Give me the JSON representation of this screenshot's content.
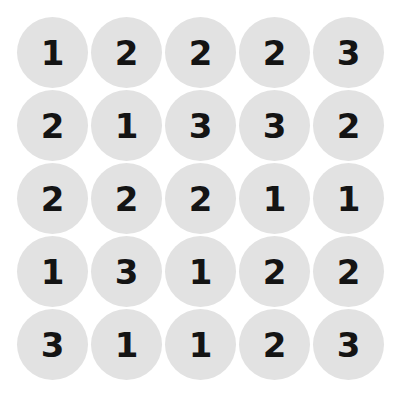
{
  "figure": {
    "name": "numbered-circle-grid",
    "background_color": "#ffffff",
    "circle_color": "#e2e2e2",
    "digit_color": "#141414",
    "rows": 5,
    "columns": 5,
    "total_circles": 25
  },
  "chart_data": {
    "type": "table",
    "title": "",
    "xlabel": "",
    "ylabel": "",
    "grid": [
      [
        "1",
        "2",
        "2",
        "2",
        "3"
      ],
      [
        "2",
        "1",
        "3",
        "3",
        "2"
      ],
      [
        "2",
        "2",
        "2",
        "1",
        "1"
      ],
      [
        "1",
        "3",
        "1",
        "2",
        "2"
      ],
      [
        "3",
        "1",
        "1",
        "2",
        "3"
      ]
    ],
    "value_set": [
      "1",
      "2",
      "3"
    ],
    "counts": {
      "1": 8,
      "2": 10,
      "3": 7
    }
  }
}
